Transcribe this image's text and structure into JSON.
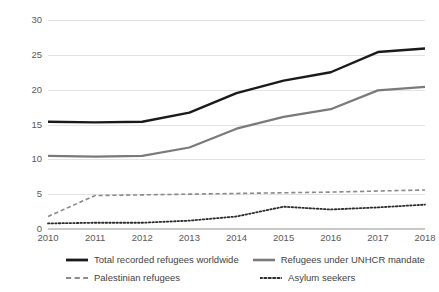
{
  "chart_data": {
    "type": "line",
    "title": "",
    "xlabel": "",
    "ylabel": "",
    "categories": [
      "2010",
      "2011",
      "2012",
      "2013",
      "2014",
      "2015",
      "2016",
      "2017",
      "2018"
    ],
    "x": [
      2010,
      2011,
      2012,
      2013,
      2014,
      2015,
      2016,
      2017,
      2018
    ],
    "ylim": [
      0,
      30
    ],
    "yticks": [
      0,
      5,
      10,
      15,
      20,
      25,
      30
    ],
    "ytick_labels": [
      "0",
      "5",
      "10",
      "15",
      "20",
      "25",
      "30"
    ],
    "grid": true,
    "legend_position": "bottom",
    "series": [
      {
        "name": "Total recorded refugees worldwide",
        "values": [
          15.4,
          15.3,
          15.4,
          16.7,
          19.5,
          21.3,
          22.5,
          25.4,
          25.9
        ],
        "color": "#1a1a1a",
        "style": "solid",
        "width": 2.4
      },
      {
        "name": "Refugees under UNHCR mandate",
        "values": [
          10.5,
          10.4,
          10.5,
          11.7,
          14.4,
          16.1,
          17.2,
          19.9,
          20.4
        ],
        "color": "#7a7a7a",
        "style": "solid",
        "width": 2.2
      },
      {
        "name": "Palestinian refugees",
        "values": [
          1.8,
          4.8,
          4.9,
          5.0,
          5.1,
          5.2,
          5.3,
          5.45,
          5.6
        ],
        "color": "#8a8a8a",
        "style": "dashed",
        "width": 1.6
      },
      {
        "name": "Asylum seekers",
        "values": [
          0.8,
          0.9,
          0.9,
          1.2,
          1.8,
          3.2,
          2.8,
          3.1,
          3.5
        ],
        "color": "#2b2b2b",
        "style": "dotted",
        "width": 1.8
      }
    ]
  },
  "legend": {
    "entries": [
      {
        "label": "Total recorded refugees worldwide"
      },
      {
        "label": "Refugees under UNHCR mandate"
      },
      {
        "label": "Palestinian refugees"
      },
      {
        "label": "Asylum seekers"
      }
    ]
  },
  "colors": {
    "background": "#ffffff",
    "gridline": "#e2e2e2",
    "axis": "#c9c9c9",
    "tick_text": "#595959",
    "legend_text": "#3f3f3f"
  }
}
